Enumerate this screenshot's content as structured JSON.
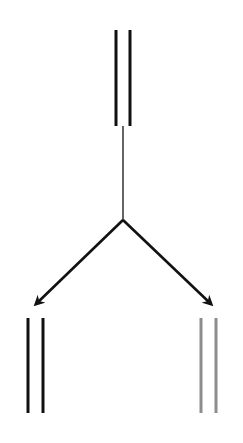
{
  "diagram": {
    "type": "branching-flow",
    "colors": {
      "background": "#ffffff",
      "primary": "#111111",
      "secondary": "#8c8c8c"
    },
    "nodes": [
      {
        "id": "top",
        "kind": "double-line",
        "color": "#111111",
        "x1": 116,
        "x2": 130,
        "y_top": 30,
        "y_bottom": 126
      },
      {
        "id": "bottom-left",
        "kind": "double-line",
        "color": "#111111",
        "x1": 28,
        "x2": 43,
        "y_top": 318,
        "y_bottom": 413
      },
      {
        "id": "bottom-right",
        "kind": "double-line",
        "color": "#8c8c8c",
        "x1": 201,
        "x2": 216,
        "y_top": 318,
        "y_bottom": 413
      }
    ],
    "edges": [
      {
        "id": "stem",
        "from": "top",
        "to": "fork",
        "arrow": false,
        "x1": 123,
        "y1": 126,
        "x2": 123,
        "y2": 220,
        "width": 1.3
      },
      {
        "id": "arrow-left",
        "from": "fork",
        "to": "bottom-left",
        "arrow": true,
        "x1": 123,
        "y1": 220,
        "x2": 36,
        "y2": 304,
        "width": 2.6
      },
      {
        "id": "arrow-right",
        "from": "fork",
        "to": "bottom-right",
        "arrow": true,
        "x1": 123,
        "y1": 220,
        "x2": 211,
        "y2": 304,
        "width": 2.6
      }
    ],
    "fork_point": {
      "x": 123,
      "y": 220
    }
  }
}
